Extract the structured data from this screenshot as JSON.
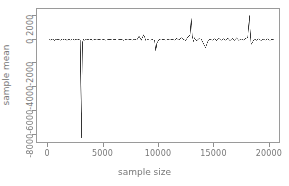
{
  "chart_data": {
    "type": "line",
    "title": "",
    "xlabel": "sample size",
    "ylabel": "sample mean",
    "xlim": [
      -1000,
      21000
    ],
    "ylim": [
      -8800,
      2600
    ],
    "xticks": [
      0,
      5000,
      10000,
      15000,
      20000
    ],
    "xticklabels": [
      "0",
      "5000",
      "10000",
      "15000",
      "20000"
    ],
    "yticks": [
      2000,
      0,
      -2000,
      -4000,
      -6000,
      -8000
    ],
    "yticklabels": [
      "2000",
      "0",
      "-2000",
      "-4000",
      "-6000",
      "-8000"
    ],
    "grid": false,
    "legend": null,
    "line_color": "#333333",
    "frame_color": "#9a9a9a",
    "background": "#ffffff",
    "series": [
      {
        "name": "sample mean",
        "x": [
          100,
          200,
          300,
          400,
          500,
          600,
          700,
          800,
          900,
          1000,
          1100,
          1200,
          1300,
          1400,
          1500,
          1600,
          1700,
          1800,
          1900,
          2000,
          2100,
          2200,
          2300,
          2400,
          2500,
          2600,
          2700,
          2800,
          2900,
          3000,
          3050,
          3100,
          3200,
          3300,
          3400,
          3500,
          3600,
          3700,
          3800,
          3900,
          4000,
          4200,
          4400,
          4600,
          4800,
          5000,
          5200,
          5400,
          5600,
          5800,
          6000,
          6200,
          6400,
          6600,
          6800,
          7000,
          7200,
          7400,
          7600,
          7800,
          8000,
          8200,
          8400,
          8600,
          8700,
          8800,
          9000,
          9200,
          9400,
          9600,
          9700,
          9750,
          9800,
          10000,
          10200,
          10400,
          10600,
          10800,
          11000,
          11200,
          11400,
          11600,
          11800,
          12000,
          12200,
          12400,
          12600,
          12800,
          12900,
          12950,
          13000,
          13100,
          13200,
          13400,
          13600,
          13800,
          14000,
          14100,
          14200,
          14300,
          14400,
          14600,
          14800,
          15000,
          15200,
          15400,
          15600,
          15800,
          16000,
          16200,
          16400,
          16600,
          16800,
          17000,
          17200,
          17400,
          17600,
          17800,
          18000,
          18100,
          18150,
          18200,
          18300,
          18400,
          18600,
          18800,
          19000,
          19200,
          19400,
          19600,
          19800,
          20000,
          20200,
          20400
        ],
        "y": [
          20,
          -30,
          40,
          -10,
          15,
          -60,
          30,
          -20,
          50,
          10,
          -40,
          25,
          -15,
          35,
          -25,
          45,
          -55,
          20,
          30,
          -35,
          15,
          -20,
          40,
          -30,
          60,
          -45,
          25,
          10,
          -20,
          -8300,
          -4000,
          -200,
          30,
          -40,
          20,
          -10,
          35,
          -25,
          15,
          40,
          -30,
          20,
          -15,
          35,
          -20,
          25,
          -35,
          15,
          30,
          -20,
          40,
          -25,
          15,
          35,
          -40,
          20,
          -15,
          30,
          -25,
          45,
          -20,
          300,
          -30,
          400,
          250,
          -40,
          20,
          -35,
          30,
          -60,
          -850,
          -700,
          -300,
          25,
          -20,
          40,
          -30,
          20,
          -15,
          35,
          -25,
          120,
          -40,
          180,
          30,
          -50,
          220,
          400,
          1800,
          1200,
          300,
          -120,
          150,
          -80,
          100,
          60,
          -300,
          -500,
          -650,
          -400,
          -150,
          60,
          -40,
          80,
          -60,
          120,
          -50,
          90,
          -30,
          140,
          -70,
          110,
          -40,
          160,
          -60,
          80,
          -30,
          100,
          200,
          1400,
          2050,
          1100,
          -400,
          -250,
          60,
          -40,
          90,
          -60,
          50,
          -30,
          80,
          -50,
          40,
          -20
        ]
      }
    ]
  },
  "axes": {
    "xlabel": "sample size",
    "ylabel": "sample mean"
  }
}
